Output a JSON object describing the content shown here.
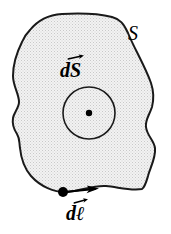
{
  "figure": {
    "type": "physics-diagram",
    "canvas": {
      "width": 171,
      "height": 234
    },
    "colors": {
      "background": "#ffffff",
      "surface_fill": "#e9e9e9",
      "outline_stroke": "#1a1a1a",
      "label_color": "#000000",
      "dot_color": "#000000"
    },
    "labels": {
      "surface": "S",
      "surface_element_base": "dS",
      "surface_element_d": "d",
      "surface_element_symbol": "S",
      "line_element_d": "d",
      "line_element_symbol": "ℓ"
    },
    "elements": {
      "surface_blob_name": "surface-region",
      "normal_circle_name": "surface-element-circle",
      "normal_dot_name": "out-of-page-dot",
      "boundary_point_name": "boundary-point",
      "boundary_arrow_name": "boundary-direction-arrow"
    },
    "geometry": {
      "circle_center_x": 89,
      "circle_center_y": 113,
      "circle_radius": 26,
      "center_dot_radius": 3,
      "boundary_point_x": 63,
      "boundary_point_y": 192,
      "boundary_point_radius": 5,
      "arrow_tip_x": 98,
      "arrow_tip_y": 189
    }
  }
}
